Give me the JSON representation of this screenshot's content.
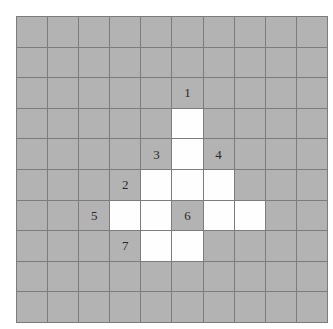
{
  "figure": {
    "kind": "grid-diagram",
    "title": "",
    "grid": {
      "rows": 10,
      "cols": 10,
      "cell_size_px": 30,
      "origin_x_px": 16,
      "origin_y_px": 16
    },
    "colors": {
      "page_background": "#ffffff",
      "cell_gray": "#b3b3b3",
      "cell_white": "#fefefe",
      "gridline": "#7c7c7c",
      "label_text": "#2a2a2a"
    },
    "legend_note": "",
    "white_cells": [
      {
        "row": 3,
        "col": 5
      },
      {
        "row": 4,
        "col": 5
      },
      {
        "row": 5,
        "col": 4
      },
      {
        "row": 5,
        "col": 5
      },
      {
        "row": 5,
        "col": 6
      },
      {
        "row": 6,
        "col": 3
      },
      {
        "row": 6,
        "col": 4
      },
      {
        "row": 6,
        "col": 6
      },
      {
        "row": 6,
        "col": 7
      },
      {
        "row": 7,
        "col": 4
      },
      {
        "row": 7,
        "col": 5
      }
    ],
    "labels": [
      {
        "text": "1",
        "row": 2,
        "col": 5
      },
      {
        "text": "3",
        "row": 4,
        "col": 4
      },
      {
        "text": "4",
        "row": 4,
        "col": 6
      },
      {
        "text": "2",
        "row": 5,
        "col": 3
      },
      {
        "text": "5",
        "row": 6,
        "col": 2
      },
      {
        "text": "6",
        "row": 6,
        "col": 5
      },
      {
        "text": "7",
        "row": 7,
        "col": 3
      }
    ],
    "cells": [
      [
        {
          "fill": "gray",
          "label": ""
        },
        {
          "fill": "gray",
          "label": ""
        },
        {
          "fill": "gray",
          "label": ""
        },
        {
          "fill": "gray",
          "label": ""
        },
        {
          "fill": "gray",
          "label": ""
        },
        {
          "fill": "gray",
          "label": ""
        },
        {
          "fill": "gray",
          "label": ""
        },
        {
          "fill": "gray",
          "label": ""
        },
        {
          "fill": "gray",
          "label": ""
        },
        {
          "fill": "gray",
          "label": ""
        }
      ],
      [
        {
          "fill": "gray",
          "label": ""
        },
        {
          "fill": "gray",
          "label": ""
        },
        {
          "fill": "gray",
          "label": ""
        },
        {
          "fill": "gray",
          "label": ""
        },
        {
          "fill": "gray",
          "label": ""
        },
        {
          "fill": "gray",
          "label": ""
        },
        {
          "fill": "gray",
          "label": ""
        },
        {
          "fill": "gray",
          "label": ""
        },
        {
          "fill": "gray",
          "label": ""
        },
        {
          "fill": "gray",
          "label": ""
        }
      ],
      [
        {
          "fill": "gray",
          "label": ""
        },
        {
          "fill": "gray",
          "label": ""
        },
        {
          "fill": "gray",
          "label": ""
        },
        {
          "fill": "gray",
          "label": ""
        },
        {
          "fill": "gray",
          "label": ""
        },
        {
          "fill": "gray",
          "label": "1"
        },
        {
          "fill": "gray",
          "label": ""
        },
        {
          "fill": "gray",
          "label": ""
        },
        {
          "fill": "gray",
          "label": ""
        },
        {
          "fill": "gray",
          "label": ""
        }
      ],
      [
        {
          "fill": "gray",
          "label": ""
        },
        {
          "fill": "gray",
          "label": ""
        },
        {
          "fill": "gray",
          "label": ""
        },
        {
          "fill": "gray",
          "label": ""
        },
        {
          "fill": "gray",
          "label": ""
        },
        {
          "fill": "white",
          "label": ""
        },
        {
          "fill": "gray",
          "label": ""
        },
        {
          "fill": "gray",
          "label": ""
        },
        {
          "fill": "gray",
          "label": ""
        },
        {
          "fill": "gray",
          "label": ""
        }
      ],
      [
        {
          "fill": "gray",
          "label": ""
        },
        {
          "fill": "gray",
          "label": ""
        },
        {
          "fill": "gray",
          "label": ""
        },
        {
          "fill": "gray",
          "label": ""
        },
        {
          "fill": "gray",
          "label": "3"
        },
        {
          "fill": "white",
          "label": ""
        },
        {
          "fill": "gray",
          "label": "4"
        },
        {
          "fill": "gray",
          "label": ""
        },
        {
          "fill": "gray",
          "label": ""
        },
        {
          "fill": "gray",
          "label": ""
        }
      ],
      [
        {
          "fill": "gray",
          "label": ""
        },
        {
          "fill": "gray",
          "label": ""
        },
        {
          "fill": "gray",
          "label": ""
        },
        {
          "fill": "gray",
          "label": "2"
        },
        {
          "fill": "white",
          "label": ""
        },
        {
          "fill": "white",
          "label": ""
        },
        {
          "fill": "white",
          "label": ""
        },
        {
          "fill": "gray",
          "label": ""
        },
        {
          "fill": "gray",
          "label": ""
        },
        {
          "fill": "gray",
          "label": ""
        }
      ],
      [
        {
          "fill": "gray",
          "label": ""
        },
        {
          "fill": "gray",
          "label": ""
        },
        {
          "fill": "gray",
          "label": "5"
        },
        {
          "fill": "white",
          "label": ""
        },
        {
          "fill": "white",
          "label": ""
        },
        {
          "fill": "gray",
          "label": "6"
        },
        {
          "fill": "white",
          "label": ""
        },
        {
          "fill": "white",
          "label": ""
        },
        {
          "fill": "gray",
          "label": ""
        },
        {
          "fill": "gray",
          "label": ""
        }
      ],
      [
        {
          "fill": "gray",
          "label": ""
        },
        {
          "fill": "gray",
          "label": ""
        },
        {
          "fill": "gray",
          "label": ""
        },
        {
          "fill": "gray",
          "label": "7"
        },
        {
          "fill": "white",
          "label": ""
        },
        {
          "fill": "white",
          "label": ""
        },
        {
          "fill": "gray",
          "label": ""
        },
        {
          "fill": "gray",
          "label": ""
        },
        {
          "fill": "gray",
          "label": ""
        },
        {
          "fill": "gray",
          "label": ""
        }
      ],
      [
        {
          "fill": "gray",
          "label": ""
        },
        {
          "fill": "gray",
          "label": ""
        },
        {
          "fill": "gray",
          "label": ""
        },
        {
          "fill": "gray",
          "label": ""
        },
        {
          "fill": "gray",
          "label": ""
        },
        {
          "fill": "gray",
          "label": ""
        },
        {
          "fill": "gray",
          "label": ""
        },
        {
          "fill": "gray",
          "label": ""
        },
        {
          "fill": "gray",
          "label": ""
        },
        {
          "fill": "gray",
          "label": ""
        }
      ],
      [
        {
          "fill": "gray",
          "label": ""
        },
        {
          "fill": "gray",
          "label": ""
        },
        {
          "fill": "gray",
          "label": ""
        },
        {
          "fill": "gray",
          "label": ""
        },
        {
          "fill": "gray",
          "label": ""
        },
        {
          "fill": "gray",
          "label": ""
        },
        {
          "fill": "gray",
          "label": ""
        },
        {
          "fill": "gray",
          "label": ""
        },
        {
          "fill": "gray",
          "label": ""
        },
        {
          "fill": "gray",
          "label": ""
        }
      ]
    ]
  }
}
